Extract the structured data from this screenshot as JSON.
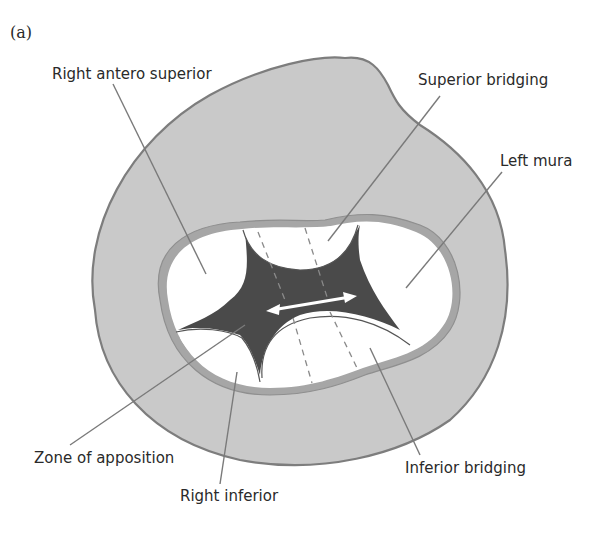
{
  "figure": {
    "panel_label": "(a)",
    "colors": {
      "outer_fill": "#c9c9c9",
      "outer_stroke": "#7d7d7d",
      "ring_stroke": "#8f8f8f",
      "leaflet_fill": "#ffffff",
      "zone_fill": "#4a4a4a",
      "leader": "#7a7a7a",
      "text": "#2a2a2a"
    },
    "labels": {
      "right_antero_superior": "Right antero superior",
      "superior_bridging": "Superior bridging",
      "left_mura": "Left mura",
      "zone_of_apposition": "Zone of apposition",
      "right_inferior": "Right inferior",
      "inferior_bridging": "Inferior bridging"
    },
    "arrow": {
      "type": "double-headed",
      "meaning": "bridging across zone of apposition"
    }
  }
}
